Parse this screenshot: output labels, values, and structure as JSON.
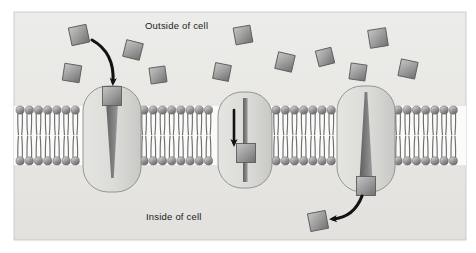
{
  "figure": {
    "type": "biology-diagram",
    "width": 476,
    "height": 253,
    "content_box": {
      "x": 14,
      "y": 12,
      "width": 452,
      "height": 228
    }
  },
  "labels": {
    "outside": "Outside of cell",
    "inside": "Inside of cell"
  },
  "colors": {
    "background": "#ffffff",
    "panel": "#e9e8e4",
    "panel_edge": "#bdbcb8",
    "membrane_band": "#ffffff",
    "lipid_head": "#8d8d8d",
    "lipid_head_light": "#c7c7c7",
    "lipid_head_dark": "#6a6a6a",
    "lipid_tail": "#6f6f6f",
    "protein_fill": "#dededa",
    "protein_fill_dark": "#c9c9c5",
    "protein_edge": "#8b8b88",
    "channel_dark": "#6e6e6e",
    "channel_mid": "#8a8a8a",
    "molecule_fill": "#9a9a9a",
    "molecule_light": "#b9b9b9",
    "molecule_dark": "#6d6d6d",
    "molecule_edge": "#5c5c5c",
    "arrow": "#121212",
    "text": "#1a1a1a"
  },
  "membrane": {
    "top_y": 106,
    "bottom_y": 165,
    "head_radius": 4.1,
    "spacing": 9.2,
    "segments": [
      {
        "name": "segment-left",
        "x_start": 16,
        "x_end": 86
      },
      {
        "name": "segment-middle-left",
        "x_start": 140,
        "x_end": 216
      },
      {
        "name": "segment-middle-right",
        "x_start": 272,
        "x_end": 338
      },
      {
        "name": "segment-right",
        "x_start": 394,
        "x_end": 466
      }
    ]
  },
  "proteins": [
    {
      "name": "channel-protein-left",
      "state": "binding",
      "center_x": 112,
      "top_y": 86,
      "bottom_y": 192,
      "width": 58,
      "pore": "funnel-down",
      "description": "Wide pore opening at outer surface narrowing to a point toward the cytoplasm"
    },
    {
      "name": "channel-protein-middle",
      "state": "transporting",
      "center_x": 245,
      "top_y": 92,
      "bottom_y": 188,
      "width": 54,
      "pore": "straight",
      "description": "Uniform narrow pore with solute midway through the channel"
    },
    {
      "name": "channel-protein-right",
      "state": "releasing",
      "center_x": 366,
      "top_y": 86,
      "bottom_y": 192,
      "width": 58,
      "pore": "funnel-up",
      "description": "Narrow pore at outer surface widening toward the cytoplasm where solute exits"
    }
  ],
  "molecules": {
    "description": "Solute particles drawn as shaded squares",
    "outside": [
      {
        "name": "molecule-outside-1",
        "x": 79,
        "y": 35,
        "size": 18,
        "rotate": -12
      },
      {
        "name": "molecule-outside-2",
        "x": 72,
        "y": 73,
        "size": 17,
        "rotate": 9
      },
      {
        "name": "molecule-outside-3",
        "x": 133,
        "y": 50,
        "size": 17,
        "rotate": 14
      },
      {
        "name": "molecule-outside-4",
        "x": 158,
        "y": 75,
        "size": 16,
        "rotate": -8
      },
      {
        "name": "molecule-outside-5",
        "x": 222,
        "y": 72,
        "size": 16,
        "rotate": 11
      },
      {
        "name": "molecule-outside-6",
        "x": 243,
        "y": 35,
        "size": 17,
        "rotate": -10
      },
      {
        "name": "molecule-outside-7",
        "x": 285,
        "y": 62,
        "size": 17,
        "rotate": 13
      },
      {
        "name": "molecule-outside-8",
        "x": 325,
        "y": 57,
        "size": 16,
        "rotate": -14
      },
      {
        "name": "molecule-outside-9",
        "x": 358,
        "y": 72,
        "size": 16,
        "rotate": 8
      },
      {
        "name": "molecule-outside-10",
        "x": 378,
        "y": 38,
        "size": 18,
        "rotate": -9
      },
      {
        "name": "molecule-outside-11",
        "x": 408,
        "y": 69,
        "size": 17,
        "rotate": 12
      }
    ],
    "bound": [
      {
        "name": "molecule-at-left-pore",
        "x": 112,
        "y": 96,
        "size": 19,
        "rotate": 0
      },
      {
        "name": "molecule-in-middle-pore",
        "x": 246,
        "y": 153,
        "size": 19,
        "rotate": 0
      },
      {
        "name": "molecule-at-right-exit",
        "x": 366,
        "y": 186,
        "size": 19,
        "rotate": 0
      }
    ],
    "inside": [
      {
        "name": "molecule-released-inside",
        "x": 318,
        "y": 221,
        "size": 18,
        "rotate": -11
      }
    ]
  },
  "arrows": [
    {
      "name": "arrow-entry",
      "direction": "down-right",
      "from": {
        "x": 92,
        "y": 40
      },
      "to": {
        "x": 113,
        "y": 85
      },
      "describes": "Solute moving from outside into the channel pore"
    },
    {
      "name": "arrow-through-channel",
      "direction": "down",
      "from": {
        "x": 234,
        "y": 110
      },
      "to": {
        "x": 234,
        "y": 147
      },
      "describes": "Solute moving down through the open channel"
    },
    {
      "name": "arrow-exit",
      "direction": "down-left",
      "from": {
        "x": 362,
        "y": 196
      },
      "to": {
        "x": 330,
        "y": 219
      },
      "describes": "Solute released into the cytoplasm"
    }
  ]
}
